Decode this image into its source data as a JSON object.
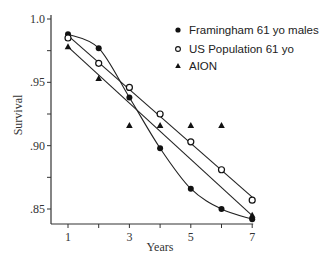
{
  "chart_data": {
    "type": "scatter",
    "title": "",
    "xlabel": "Years",
    "ylabel": "Survival",
    "xlim": [
      0.6,
      7.1
    ],
    "ylim": [
      0.835,
      1.0
    ],
    "x_ticks": [
      1,
      2,
      3,
      4,
      5,
      6,
      7
    ],
    "x_tick_labels": [
      "1",
      "",
      "3",
      "",
      "5",
      "",
      "7"
    ],
    "y_ticks": [
      0.85,
      0.875,
      0.9,
      0.925,
      0.95,
      0.975,
      1.0
    ],
    "y_tick_labels": [
      ".85",
      "",
      ".90",
      "",
      ".95",
      "",
      "1.0"
    ],
    "grid": false,
    "legend_position": "upper right",
    "x": [
      1,
      2,
      3,
      4,
      5,
      6,
      7
    ],
    "series": [
      {
        "name": "Framingham 61 yo males",
        "marker": "filled-circle",
        "fit": "smooth curve",
        "values": [
          0.988,
          0.977,
          0.938,
          0.898,
          0.866,
          0.85,
          0.842
        ]
      },
      {
        "name": "US Population 61 yo",
        "marker": "open-circle",
        "fit": "straight line",
        "values": [
          0.985,
          0.965,
          0.946,
          0.925,
          0.903,
          0.881,
          0.857
        ]
      },
      {
        "name": "AION",
        "marker": "filled-triangle",
        "fit": "straight line",
        "values": [
          0.978,
          0.953,
          0.916,
          0.916,
          0.916,
          0.916,
          0.845
        ]
      }
    ]
  },
  "legend": {
    "items": [
      {
        "label": "Framingham 61 yo males",
        "symbol": "●"
      },
      {
        "label": "US Population 61 yo",
        "symbol": "○"
      },
      {
        "label": "AION",
        "symbol": "▲"
      }
    ]
  },
  "axes": {
    "xlabel": "Years",
    "ylabel": "Survival",
    "x_tick_labels": [
      "1",
      "3",
      "5",
      "7"
    ],
    "y_tick_labels": [
      "1.0",
      ".95",
      ".90",
      ".85"
    ]
  }
}
